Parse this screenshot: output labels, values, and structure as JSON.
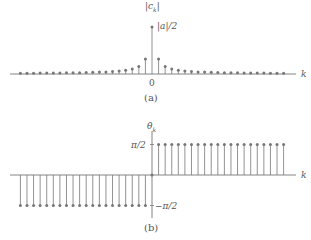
{
  "panel_a": {
    "caption": "(a)",
    "ylabel": "|c_k|",
    "ylabel_display": "|ck|",
    "peak_label": "|a|/2",
    "xlabel": "k",
    "origin_label": "0"
  },
  "panel_b": {
    "caption": "(b)",
    "ylabel": "θ_k",
    "ylabel_display": "θk",
    "pos_label": "π/2",
    "neg_label": "−π/2",
    "xlabel": "k"
  },
  "chart_data": [
    {
      "type": "stem",
      "title": "(a) magnitude spectrum |c_k|",
      "xlabel": "k",
      "ylabel": "|c_k|",
      "annotations": [
        "|a|/2 at k=0",
        "0 at origin"
      ],
      "k_range": [
        -20,
        20
      ],
      "note": "peak |a|/2 at k=0, decaying as 1/|k| on both sides",
      "k": [
        -20,
        -19,
        -18,
        -17,
        -16,
        -15,
        -14,
        -13,
        -12,
        -11,
        -10,
        -9,
        -8,
        -7,
        -6,
        -5,
        -4,
        -3,
        -2,
        -1,
        0,
        1,
        2,
        3,
        4,
        5,
        6,
        7,
        8,
        9,
        10,
        11,
        12,
        13,
        14,
        15,
        16,
        17,
        18,
        19,
        20
      ],
      "values": [
        0.016,
        0.017,
        0.018,
        0.019,
        0.02,
        0.021,
        0.023,
        0.024,
        0.027,
        0.029,
        0.032,
        0.035,
        0.04,
        0.045,
        0.053,
        0.064,
        0.08,
        0.106,
        0.159,
        0.318,
        1.0,
        0.318,
        0.159,
        0.106,
        0.08,
        0.064,
        0.053,
        0.045,
        0.04,
        0.035,
        0.032,
        0.029,
        0.027,
        0.024,
        0.023,
        0.021,
        0.02,
        0.019,
        0.018,
        0.017,
        0.016
      ],
      "ylim": [
        0,
        1.0
      ],
      "grid": false
    },
    {
      "type": "stem",
      "title": "(b) phase spectrum θ_k",
      "xlabel": "k",
      "ylabel": "θ_k",
      "tick_labels_y": [
        "π/2",
        "−π/2"
      ],
      "k_range": [
        -20,
        20
      ],
      "k": [
        -20,
        -19,
        -18,
        -17,
        -16,
        -15,
        -14,
        -13,
        -12,
        -11,
        -10,
        -9,
        -8,
        -7,
        -6,
        -5,
        -4,
        -3,
        -2,
        -1,
        0,
        1,
        2,
        3,
        4,
        5,
        6,
        7,
        8,
        9,
        10,
        11,
        12,
        13,
        14,
        15,
        16,
        17,
        18,
        19,
        20
      ],
      "values": [
        -1.5708,
        -1.5708,
        -1.5708,
        -1.5708,
        -1.5708,
        -1.5708,
        -1.5708,
        -1.5708,
        -1.5708,
        -1.5708,
        -1.5708,
        -1.5708,
        -1.5708,
        -1.5708,
        -1.5708,
        -1.5708,
        -1.5708,
        -1.5708,
        -1.5708,
        -1.5708,
        0,
        1.5708,
        1.5708,
        1.5708,
        1.5708,
        1.5708,
        1.5708,
        1.5708,
        1.5708,
        1.5708,
        1.5708,
        1.5708,
        1.5708,
        1.5708,
        1.5708,
        1.5708,
        1.5708,
        1.5708,
        1.5708,
        1.5708,
        1.5708
      ],
      "ylim": [
        -1.5708,
        1.5708
      ],
      "grid": false
    }
  ]
}
